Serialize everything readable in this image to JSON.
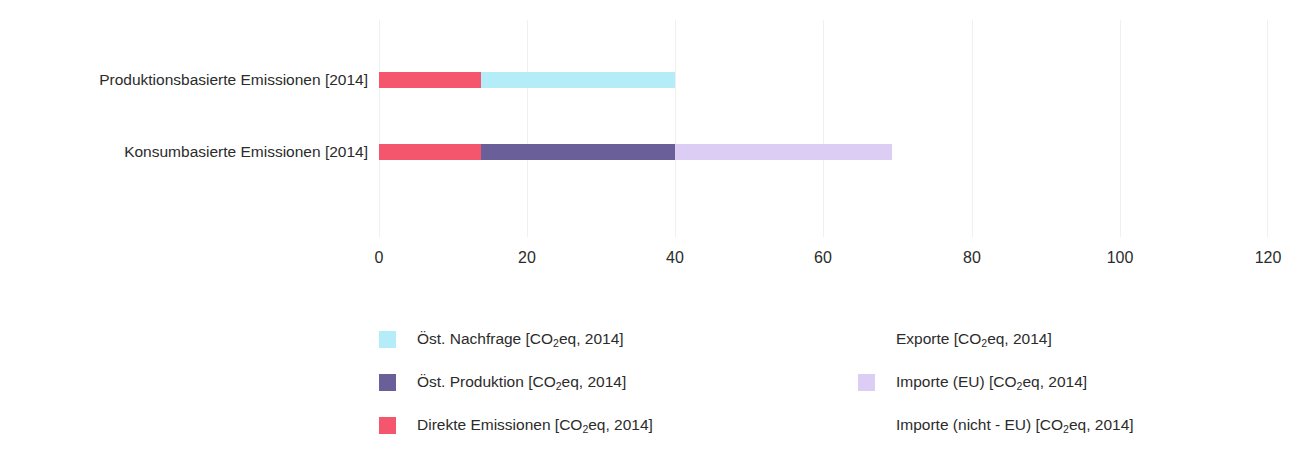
{
  "chart_data": {
    "type": "bar",
    "orientation": "horizontal",
    "stacked": true,
    "title": "",
    "xlabel": "",
    "ylabel": "",
    "xlim": [
      0,
      120
    ],
    "xticks": [
      0,
      20,
      40,
      60,
      80,
      100,
      120
    ],
    "xtick_labels": [
      "0",
      "20",
      "40",
      "60",
      "80",
      "100",
      "120"
    ],
    "grid": true,
    "grid_axis": "x",
    "legend_position": "below",
    "categories": [
      "Produktionsbasierte Emissionen [2014]",
      "Konsumbasierte Emissionen [2014]"
    ],
    "series": [
      {
        "name": "Direkte Emissionen [CO2eq, 2014]",
        "color": "#f4566e",
        "values": [
          13.8,
          13.8
        ]
      },
      {
        "name": "Öst. Nachfrage [CO2eq, 2014]",
        "color": "#b4ecf7",
        "values": [
          26.2,
          0
        ]
      },
      {
        "name": "Öst. Produktion [CO2eq, 2014]",
        "color": "#6b5f99",
        "values": [
          0,
          26.2
        ]
      },
      {
        "name": "Importe (EU) [CO2eq, 2014]",
        "color": "#dccdf5",
        "values": [
          0,
          29.2
        ]
      },
      {
        "name": "Exporte [CO2eq, 2014]",
        "color": "#ffffff",
        "values": [
          0,
          0
        ]
      },
      {
        "name": "Importe (nicht - EU) [CO2eq, 2014]",
        "color": "#ffffff",
        "values": [
          0,
          0
        ]
      }
    ],
    "bar_totals": [
      40,
      69.2
    ],
    "annotations": []
  },
  "axis": {
    "x_tick_labels": [
      "0",
      "20",
      "40",
      "60",
      "80",
      "100",
      "120"
    ],
    "category_labels": [
      "Produktionsbasierte Emissionen [2014]",
      "Konsumbasierte Emissionen [2014]"
    ]
  },
  "bars": [
    {
      "category": "Produktionsbasierte Emissionen [2014]",
      "segments": [
        {
          "label": "Direkte Emissionen [CO2eq, 2014]",
          "start": 0,
          "end": 13.8,
          "color": "#f4566e"
        },
        {
          "label": "Öst. Nachfrage [CO2eq, 2014]",
          "start": 13.8,
          "end": 40,
          "color": "#b4ecf7"
        }
      ]
    },
    {
      "category": "Konsumbasierte Emissionen [2014]",
      "segments": [
        {
          "label": "Direkte Emissionen [CO2eq, 2014]",
          "start": 0,
          "end": 13.8,
          "color": "#f4566e"
        },
        {
          "label": "Öst. Produktion [CO2eq, 2014]",
          "start": 13.8,
          "end": 40,
          "color": "#6b5f99"
        },
        {
          "label": "Importe (EU) [CO2eq, 2014]",
          "start": 40,
          "end": 69.2,
          "color": "#dccdf5"
        }
      ]
    }
  ],
  "legend": {
    "left_column": [
      {
        "label_prefix": "Öst. Nachfrage [CO",
        "sub": "2",
        "label_suffix": "eq, 2014]",
        "color": "#b4ecf7"
      },
      {
        "label_prefix": "Öst. Produktion [CO",
        "sub": "2",
        "label_suffix": "eq, 2014]",
        "color": "#6b5f99"
      },
      {
        "label_prefix": "Direkte Emissionen [CO",
        "sub": "2",
        "label_suffix": "eq, 2014]",
        "color": "#f4566e"
      }
    ],
    "right_column": [
      {
        "label_prefix": "Exporte [CO",
        "sub": "2",
        "label_suffix": "eq, 2014]",
        "color": "#ffffff"
      },
      {
        "label_prefix": "Importe (EU) [CO",
        "sub": "2",
        "label_suffix": "eq, 2014]",
        "color": "#dccdf5"
      },
      {
        "label_prefix": "Importe (nicht - EU) [CO",
        "sub": "2",
        "label_suffix": "eq, 2014]",
        "color": "#ffffff"
      }
    ]
  },
  "colors": {
    "direkte_emissionen": "#f4566e",
    "oest_nachfrage": "#b4ecf7",
    "oest_produktion": "#6b5f99",
    "importe_eu": "#dccdf5",
    "exporte": "#ffffff",
    "importe_nicht_eu": "#ffffff",
    "gridline": "#f0eff2",
    "text": "#2b2b2b"
  }
}
